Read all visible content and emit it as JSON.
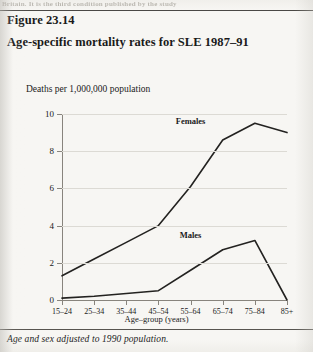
{
  "page": {
    "bleed_text_top": "Britain. It is the third condition published by the study",
    "figure_number": "Figure 23.14",
    "figure_title": "Age-specific mortality rates for SLE 1987–91",
    "figure_note": "Age and sex adjusted to 1990 population."
  },
  "chart_data": {
    "type": "line",
    "title": "Age-specific mortality rates for SLE 1987–91",
    "xlabel": "Age–group (years)",
    "ylabel": "Deaths per 1,000,000 population",
    "categories": [
      "15–24",
      "25–34",
      "35–44",
      "45–54",
      "55–64",
      "65–74",
      "75–84",
      "85+"
    ],
    "yticks": [
      0,
      2,
      4,
      6,
      8,
      10
    ],
    "ylim": [
      0,
      10
    ],
    "grid": true,
    "legend": "inline-labels",
    "series": [
      {
        "name": "Females",
        "values": [
          1.3,
          2.2,
          3.1,
          4.0,
          6.1,
          8.6,
          9.5,
          9.0
        ],
        "label_x_category": "55–64",
        "label_y_value": 9.6
      },
      {
        "name": "Males",
        "values": [
          0.1,
          0.2,
          0.35,
          0.5,
          1.6,
          2.7,
          3.2,
          0.0
        ],
        "label_x_category": "55–64",
        "label_y_value": 3.5
      }
    ]
  }
}
